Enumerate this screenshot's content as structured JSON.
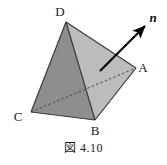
{
  "figure": {
    "caption": "図 4.10",
    "background_color": "#ffffff",
    "width": 167,
    "height": 165,
    "solid": {
      "name": "tetrahedron",
      "vertices": [
        {
          "id": "D",
          "label": "D",
          "x": 66,
          "y": 22,
          "label_x": 60,
          "label_y": 16
        },
        {
          "id": "A",
          "label": "A",
          "x": 136,
          "y": 68,
          "label_x": 141,
          "label_y": 71
        },
        {
          "id": "B",
          "label": "B",
          "x": 95,
          "y": 120,
          "label_x": 91,
          "label_y": 134
        },
        {
          "id": "C",
          "label": "C",
          "x": 31,
          "y": 112,
          "label_x": 14,
          "label_y": 120
        }
      ],
      "faces": [
        {
          "id": "DCB",
          "vertices": "D,C,B",
          "fill": "#8e8e8e",
          "points": "66,22 31,112 95,120",
          "shading": "dark"
        },
        {
          "id": "DBA",
          "vertices": "D,B,A",
          "fill": "#bcbcbc",
          "points": "66,22 95,120 136,68",
          "shading": "light"
        },
        {
          "id": "CBA",
          "vertices": "C,B,A",
          "fill": "#a0a0a0",
          "points": "31,112 95,120 136,68",
          "shading": "medium"
        }
      ],
      "edges": [
        {
          "id": "DC",
          "from": "D",
          "to": "C",
          "style": "solid"
        },
        {
          "id": "DB",
          "from": "D",
          "to": "B",
          "style": "solid"
        },
        {
          "id": "DA",
          "from": "D",
          "to": "A",
          "style": "solid"
        },
        {
          "id": "CB",
          "from": "C",
          "to": "B",
          "style": "solid"
        },
        {
          "id": "BA",
          "from": "B",
          "to": "A",
          "style": "solid"
        },
        {
          "id": "CA",
          "from": "C",
          "to": "A",
          "style": "dashed",
          "hidden": true
        }
      ],
      "edge_color": "#3a3a3a"
    },
    "normal_vector": {
      "label": "n",
      "tail_x": 100,
      "tail_y": 71,
      "head_x": 148,
      "head_y": 23,
      "label_x": 152,
      "label_y": 20,
      "color": "#000000",
      "description": "outward normal of face DBA"
    }
  }
}
